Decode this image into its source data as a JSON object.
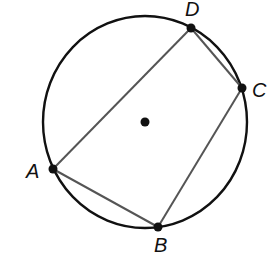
{
  "diagram": {
    "type": "inscribed-quadrilateral",
    "colors": {
      "circle": "#111111",
      "segments": "#555555",
      "points": "#111111",
      "background": "#ffffff"
    },
    "circle": {
      "cx": 145,
      "cy": 122,
      "rx": 102,
      "ry": 106
    },
    "center": {
      "x": 145,
      "y": 122
    },
    "points": [
      {
        "name": "A",
        "x": 53,
        "y": 169,
        "label": "A",
        "label_x": 26,
        "label_y": 178
      },
      {
        "name": "B",
        "x": 158,
        "y": 227,
        "label": "B",
        "label_x": 154,
        "label_y": 252
      },
      {
        "name": "C",
        "x": 242,
        "y": 88,
        "label": "C",
        "label_x": 252,
        "label_y": 97
      },
      {
        "name": "D",
        "x": 191,
        "y": 28,
        "label": "D",
        "label_x": 185,
        "label_y": 16
      }
    ],
    "segments": [
      {
        "from": "A",
        "to": "B"
      },
      {
        "from": "B",
        "to": "C"
      },
      {
        "from": "C",
        "to": "D"
      },
      {
        "from": "D",
        "to": "A"
      }
    ]
  }
}
